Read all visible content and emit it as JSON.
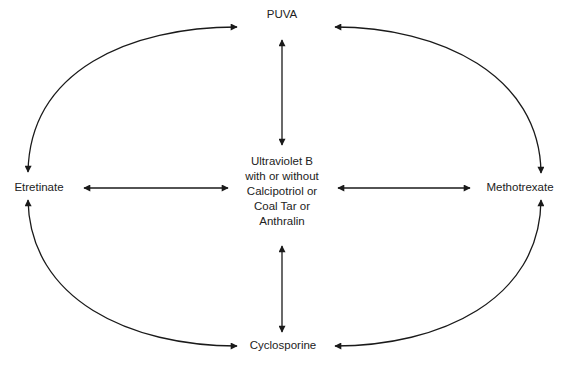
{
  "diagram": {
    "type": "treatment-rotation-diagram",
    "nodes": {
      "top": "PUVA",
      "left": "Etretinate",
      "right": "Methotrexate",
      "bottom": "Cyclosporine",
      "center": {
        "lines": [
          "Ultraviolet B",
          "with or without",
          "Calcipotriol or",
          "Coal Tar or",
          "Anthralin"
        ]
      }
    },
    "edges": [
      {
        "from": "PUVA",
        "to": "Ultraviolet B with or without Calcipotriol or Coal Tar or Anthralin",
        "direction": "bidirectional",
        "shape": "straight"
      },
      {
        "from": "Cyclosporine",
        "to": "Ultraviolet B with or without Calcipotriol or Coal Tar or Anthralin",
        "direction": "bidirectional",
        "shape": "straight"
      },
      {
        "from": "Etretinate",
        "to": "Ultraviolet B with or without Calcipotriol or Coal Tar or Anthralin",
        "direction": "bidirectional",
        "shape": "straight"
      },
      {
        "from": "Methotrexate",
        "to": "Ultraviolet B with or without Calcipotriol or Coal Tar or Anthralin",
        "direction": "bidirectional",
        "shape": "straight"
      },
      {
        "from": "Etretinate",
        "to": "PUVA",
        "direction": "bidirectional",
        "shape": "arc"
      },
      {
        "from": "PUVA",
        "to": "Methotrexate",
        "direction": "bidirectional",
        "shape": "arc"
      },
      {
        "from": "Etretinate",
        "to": "Cyclosporine",
        "direction": "bidirectional",
        "shape": "arc"
      },
      {
        "from": "Cyclosporine",
        "to": "Methotrexate",
        "direction": "bidirectional",
        "shape": "arc"
      }
    ],
    "colors": {
      "line": "#1a1a1a",
      "background": "#ffffff"
    }
  }
}
